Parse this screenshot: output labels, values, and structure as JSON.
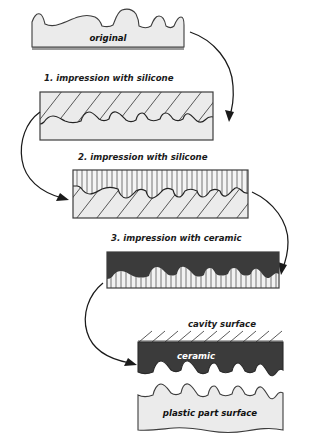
{
  "figure": {
    "title_text": "Replication of surface structure from original to plastic part",
    "background_color": "#ffffff",
    "ink_color": "#1a1a1a",
    "fill_light": "#ebebeb",
    "fill_dark": "#3b3b3b",
    "width_px": 323,
    "height_px": 436
  },
  "stages": [
    {
      "id": "original",
      "caption": "original",
      "caption_position": "inside",
      "caption_color": "#111111",
      "fill": "#ebebeb",
      "pattern": "none",
      "profile": "rough-top"
    },
    {
      "id": "step1",
      "step_number": "1.",
      "caption": "1. impression with silicone",
      "caption_position": "above",
      "caption_color": "#1a1a1a",
      "fill": "#ebebeb",
      "pattern": "diagonal-hatch",
      "profile": "rough-inverted-top"
    },
    {
      "id": "step2",
      "step_number": "2.",
      "caption": "2. impression with silicone",
      "caption_position": "above",
      "caption_color": "#1a1a1a",
      "fill": "#ebebeb",
      "pattern": "vertical-lines-over-diagonal-hatch",
      "profile": "rough-mid"
    },
    {
      "id": "step3",
      "step_number": "3.",
      "caption": "3. impression with ceramic",
      "caption_position": "above",
      "caption_color": "#1a1a1a",
      "fill": "#3b3b3b",
      "pattern": "vertical-lines-lower",
      "profile": "rough-inverted-mid"
    }
  ],
  "result": {
    "cavity_label": "cavity surface",
    "ceramic_label": "ceramic",
    "plastic_label": "plastic part surface",
    "ceramic_fill": "#3b3b3b",
    "plastic_fill": "#ebebeb",
    "cavity_hatch": "diagonal-ticks"
  },
  "arrows": [
    {
      "id": "arrow-original-to-step1",
      "from": "original",
      "to": "step1",
      "direction": "clockwise-right"
    },
    {
      "id": "arrow-step1-to-step2",
      "from": "step1",
      "to": "step2",
      "direction": "counterclockwise-left"
    },
    {
      "id": "arrow-step2-to-step3",
      "from": "step2",
      "to": "step3",
      "direction": "clockwise-right"
    },
    {
      "id": "arrow-step3-to-result",
      "from": "step3",
      "to": "result",
      "direction": "counterclockwise-left"
    }
  ]
}
